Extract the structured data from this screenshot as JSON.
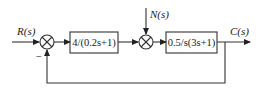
{
  "diagram": {
    "type": "block-diagram",
    "signals": {
      "input": "R(s)",
      "disturbance": "N(s)",
      "output": "C(s)"
    },
    "blocks": [
      {
        "id": "G1",
        "label": "4/(0.2s+1)"
      },
      {
        "id": "G2",
        "label": "0.5/s(3s+1)"
      }
    ],
    "summing_junctions": [
      {
        "id": "S1",
        "inputs": [
          "R(s)",
          "feedback"
        ],
        "feedback_sign": "−"
      },
      {
        "id": "S2",
        "inputs": [
          "G1 output",
          "N(s)"
        ]
      }
    ],
    "feedback": "unity negative feedback from C(s) to S1",
    "colors": {
      "stroke": "#333333",
      "text": "#222222",
      "background": "#ffffff"
    }
  }
}
